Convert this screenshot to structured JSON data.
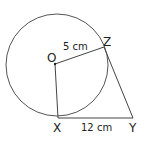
{
  "diagram": {
    "type": "geometry",
    "stroke_color": "#555555",
    "points": {
      "O": {
        "label": "O",
        "x": 55,
        "y": 64
      },
      "X": {
        "label": "X",
        "x": 58,
        "y": 118
      },
      "Y": {
        "label": "Y",
        "x": 133,
        "y": 118
      },
      "Z": {
        "label": "Z",
        "x": 104,
        "y": 47
      }
    },
    "circle": {
      "cx": 57,
      "cy": 65,
      "r": 51
    },
    "measurements": {
      "OZ": "5 cm",
      "XY": "12 cm"
    }
  }
}
